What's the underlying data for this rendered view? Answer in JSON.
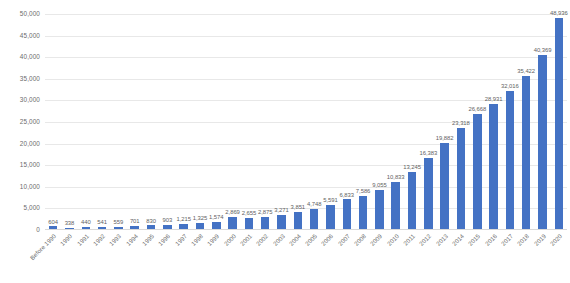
{
  "chart_data": {
    "type": "bar",
    "title": "",
    "subtitle": "",
    "xlabel": "",
    "ylabel": "",
    "ylim": [
      0,
      50000
    ],
    "y_ticks": [
      "0",
      "5,000",
      "10,000",
      "15,000",
      "20,000",
      "25,000",
      "30,000",
      "35,000",
      "40,000",
      "45,000",
      "50,000"
    ],
    "y_tick_values": [
      0,
      5000,
      10000,
      15000,
      20000,
      25000,
      30000,
      35000,
      40000,
      45000,
      50000
    ],
    "grid": "horizontal",
    "legend": "none",
    "series_color": "#4472C4",
    "categories": [
      "Before 1990",
      "1990",
      "1991",
      "1992",
      "1993",
      "1994",
      "1995",
      "1996",
      "1997",
      "1998",
      "1999",
      "2000",
      "2001",
      "2002",
      "2003",
      "2004",
      "2005",
      "2006",
      "2007",
      "2008",
      "2009",
      "2010",
      "2011",
      "2012",
      "2013",
      "2014",
      "2015",
      "2016",
      "2017",
      "2018",
      "2019",
      "2020"
    ],
    "values": [
      604,
      338,
      440,
      541,
      559,
      701,
      830,
      903,
      1215,
      1325,
      1574,
      2869,
      2655,
      2875,
      3271,
      3851,
      4748,
      5591,
      6833,
      7586,
      9055,
      10833,
      13245,
      16383,
      19882,
      23318,
      26668,
      28931,
      32016,
      35422,
      40369,
      48936
    ],
    "data_labels": [
      "604",
      "338",
      "440",
      "541",
      "559",
      "701",
      "830",
      "903",
      "1,215",
      "1,325",
      "1,574",
      "2,869",
      "2,655",
      "2,875",
      "3,271",
      "3,851",
      "4,748",
      "5,591",
      "6,833",
      "7,586",
      "9,055",
      "10,833",
      "13,245",
      "16,383",
      "19,882",
      "23,318",
      "26,668",
      "28,931",
      "32,016",
      "35,422",
      "40,369",
      "48,936"
    ]
  }
}
